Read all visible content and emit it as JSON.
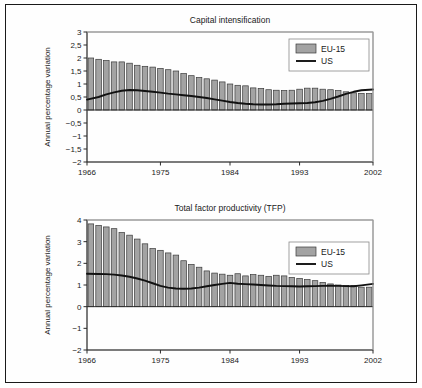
{
  "figure": {
    "panels": [
      "capital_intensification",
      "tfp"
    ],
    "colors": {
      "bar_fill": "#a3a3a3",
      "bar_stroke": "#3a3a3a",
      "line": "#111111",
      "axis": "#2b2b2b",
      "frame": "#1a1a1a",
      "background": "#ffffff"
    }
  },
  "chart_data": [
    {
      "type": "bar",
      "id": "capital_intensification",
      "title": "Capital intensification",
      "xlabel": "",
      "ylabel": "Annual percentage variation",
      "xlim": [
        1966,
        2002
      ],
      "ylim": [
        -2,
        3
      ],
      "ytick_labels": [
        "3",
        "2,5",
        "2",
        "1,5",
        "1",
        "0,5",
        "0",
        "−0,5",
        "−1",
        "−1,5",
        "−2"
      ],
      "ytick_values": [
        3,
        2.5,
        2,
        1.5,
        1,
        0.5,
        0,
        -0.5,
        -1,
        -1.5,
        -2
      ],
      "xtick_labels": [
        "1966",
        "1975",
        "1984",
        "1993",
        "2002"
      ],
      "xtick_values": [
        1966,
        1975,
        1984,
        1993,
        2002
      ],
      "grid": false,
      "legend_position": "top-right",
      "legend": [
        "EU-15",
        "US"
      ],
      "x": [
        1966,
        1967,
        1968,
        1969,
        1970,
        1971,
        1972,
        1973,
        1974,
        1975,
        1976,
        1977,
        1978,
        1979,
        1980,
        1981,
        1982,
        1983,
        1984,
        1985,
        1986,
        1987,
        1988,
        1989,
        1990,
        1991,
        1992,
        1993,
        1994,
        1995,
        1996,
        1997,
        1998,
        1999,
        2000,
        2001,
        2002
      ],
      "series": [
        {
          "name": "EU-15",
          "kind": "bar",
          "values": [
            2.0,
            1.95,
            1.9,
            1.85,
            1.85,
            1.8,
            1.72,
            1.68,
            1.65,
            1.6,
            1.55,
            1.5,
            1.4,
            1.32,
            1.25,
            1.2,
            1.15,
            1.08,
            1.0,
            0.95,
            0.93,
            0.85,
            0.83,
            0.78,
            0.76,
            0.75,
            0.76,
            0.8,
            0.84,
            0.84,
            0.8,
            0.78,
            0.75,
            0.7,
            0.66,
            0.64,
            0.63
          ]
        },
        {
          "name": "US",
          "kind": "line",
          "values": [
            0.4,
            0.5,
            0.6,
            0.68,
            0.74,
            0.77,
            0.76,
            0.73,
            0.7,
            0.67,
            0.63,
            0.6,
            0.57,
            0.54,
            0.5,
            0.46,
            0.41,
            0.36,
            0.31,
            0.27,
            0.24,
            0.22,
            0.21,
            0.21,
            0.22,
            0.24,
            0.25,
            0.26,
            0.27,
            0.3,
            0.35,
            0.43,
            0.52,
            0.62,
            0.7,
            0.76,
            0.79
          ]
        }
      ]
    },
    {
      "type": "bar",
      "id": "tfp",
      "title": "Total factor productivity (TFP)",
      "xlabel": "",
      "ylabel": "Annual percentage variation",
      "xlim": [
        1966,
        2002
      ],
      "ylim": [
        -2,
        4
      ],
      "ytick_labels": [
        "4",
        "3",
        "2",
        "1",
        "0",
        "−1",
        "−2"
      ],
      "ytick_values": [
        4,
        3,
        2,
        1,
        0,
        -1,
        -2
      ],
      "xtick_labels": [
        "1966",
        "1975",
        "1984",
        "1993",
        "2002"
      ],
      "xtick_values": [
        1966,
        1975,
        1984,
        1993,
        2002
      ],
      "grid": false,
      "legend_position": "top-right",
      "legend": [
        "EU-15",
        "US"
      ],
      "x": [
        1966,
        1967,
        1968,
        1969,
        1970,
        1971,
        1972,
        1973,
        1974,
        1975,
        1976,
        1977,
        1978,
        1979,
        1980,
        1981,
        1982,
        1983,
        1984,
        1985,
        1986,
        1987,
        1988,
        1989,
        1990,
        1991,
        1992,
        1993,
        1994,
        1995,
        1996,
        1997,
        1998,
        1999,
        2000,
        2001,
        2002
      ],
      "series": [
        {
          "name": "EU-15",
          "kind": "bar",
          "values": [
            3.82,
            3.75,
            3.68,
            3.6,
            3.42,
            3.3,
            3.12,
            2.9,
            2.68,
            2.6,
            2.48,
            2.38,
            2.12,
            1.95,
            1.82,
            1.65,
            1.55,
            1.5,
            1.45,
            1.52,
            1.42,
            1.48,
            1.45,
            1.4,
            1.45,
            1.42,
            1.35,
            1.3,
            1.25,
            1.2,
            1.12,
            1.05,
            1.0,
            0.98,
            0.97,
            0.9,
            0.9
          ]
        },
        {
          "name": "US",
          "kind": "line",
          "values": [
            1.52,
            1.51,
            1.5,
            1.48,
            1.44,
            1.38,
            1.3,
            1.2,
            1.08,
            0.96,
            0.88,
            0.84,
            0.83,
            0.84,
            0.88,
            0.94,
            1.0,
            1.05,
            1.1,
            1.06,
            1.04,
            1.02,
            1.0,
            0.98,
            0.96,
            0.95,
            0.94,
            0.93,
            0.94,
            0.95,
            0.96,
            0.97,
            0.96,
            0.95,
            0.94,
            0.98,
            1.05
          ]
        }
      ]
    }
  ]
}
